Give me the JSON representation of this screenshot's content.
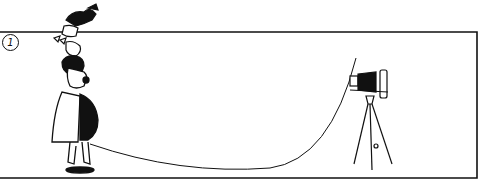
{
  "panel": {
    "number": "1",
    "description": "Cartoon panel: a man with a child perched on his head stands at left, a long cable runs from him to a bellows camera on a tripod at right"
  },
  "colors": {
    "ink": "#111111",
    "paper": "#ffffff"
  }
}
